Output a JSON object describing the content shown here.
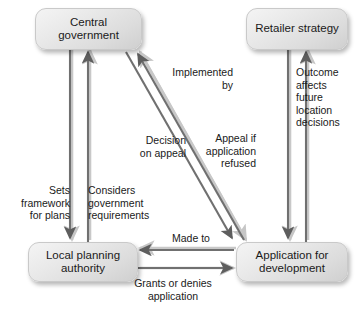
{
  "diagram": {
    "nodes": [
      {
        "id": "central",
        "label": "Central\ngovernment"
      },
      {
        "id": "retailer",
        "label": "Retailer\nstrategy"
      },
      {
        "id": "lpa",
        "label": "Local planning\nauthority"
      },
      {
        "id": "app",
        "label": "Application for\ndevelopment"
      }
    ],
    "edge_labels": {
      "implemented_by": "Implemented\nby",
      "outcome_affects": "Outcome\naffects\nfuture\nlocation\ndecisions",
      "decision_on_appeal": "Decision\non appeal",
      "appeal_if_refused": "Appeal if\napplication\nrefused",
      "sets_framework": "Sets\nframework\nfor plans",
      "considers_requirements": "Considers\ngovernment\nrequirements",
      "made_to": "Made to",
      "grants_or_denies": "Grants or denies\napplication"
    },
    "colors": {
      "line": "#6f6f6f",
      "shadow": "#c9c9c9",
      "node_fill_light": "#f2f2f2",
      "node_fill_dark": "#cfcfcf",
      "text": "#1a1a1a",
      "background": "#ffffff"
    }
  }
}
